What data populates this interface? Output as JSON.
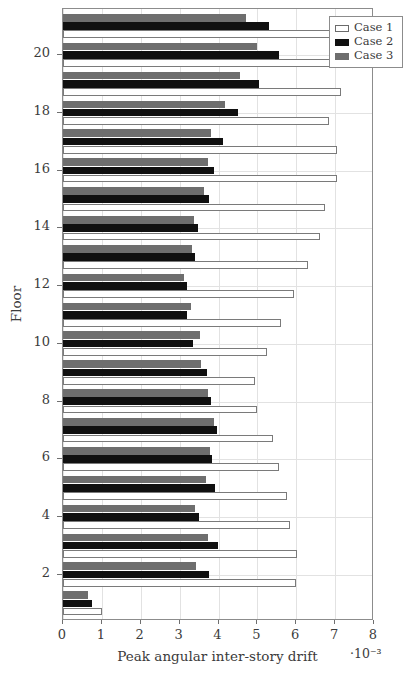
{
  "chart_data": {
    "type": "bar",
    "orientation": "horizontal",
    "title": "",
    "xlabel": "Peak angular inter-story drift",
    "xlabel_exponent": "·10⁻³",
    "ylabel": "Floor",
    "xlim": [
      0,
      8
    ],
    "ylim": [
      0.4,
      21.6
    ],
    "xticks": [
      0,
      1,
      2,
      3,
      4,
      5,
      6,
      7,
      8
    ],
    "xticklabels": [
      "0",
      "1",
      "2",
      "3",
      "4",
      "5",
      "6",
      "7",
      "8"
    ],
    "yticks": [
      2,
      4,
      6,
      8,
      10,
      12,
      14,
      16,
      18,
      20
    ],
    "yticklabels": [
      "2",
      "4",
      "6",
      "8",
      "10",
      "12",
      "14",
      "16",
      "18",
      "20"
    ],
    "grid": true,
    "legend_position": "upper right",
    "categories": [
      1,
      2,
      3,
      4,
      5,
      6,
      7,
      8,
      9,
      10,
      11,
      12,
      13,
      14,
      15,
      16,
      17,
      18,
      19,
      20,
      21
    ],
    "series": [
      {
        "name": "Case 1",
        "color": "#ffffff",
        "edgecolor": "#7a7a7a",
        "values": [
          1.0,
          6.0,
          6.02,
          5.85,
          5.75,
          5.55,
          5.4,
          5.0,
          4.95,
          5.25,
          5.6,
          5.95,
          6.3,
          6.6,
          6.75,
          7.05,
          7.05,
          6.85,
          7.15,
          7.1,
          6.95
        ]
      },
      {
        "name": "Case 2",
        "color": "#101010",
        "values": [
          0.75,
          3.75,
          3.98,
          3.5,
          3.92,
          3.82,
          3.95,
          3.8,
          3.7,
          3.35,
          3.2,
          3.18,
          3.4,
          3.48,
          3.75,
          3.88,
          4.12,
          4.5,
          5.05,
          5.55,
          5.3
        ]
      },
      {
        "name": "Case 3",
        "color": "#6e6e6e",
        "values": [
          0.65,
          3.42,
          3.72,
          3.4,
          3.68,
          3.78,
          3.88,
          3.72,
          3.55,
          3.52,
          3.3,
          3.12,
          3.32,
          3.38,
          3.62,
          3.72,
          3.8,
          4.18,
          4.55,
          4.98,
          4.7
        ]
      }
    ]
  },
  "legend": {
    "items": [
      {
        "label": "Case 1",
        "swatch": "case-1-swatch"
      },
      {
        "label": "Case 2",
        "swatch": "case-2-swatch"
      },
      {
        "label": "Case 3",
        "swatch": "case-3-swatch"
      }
    ]
  }
}
